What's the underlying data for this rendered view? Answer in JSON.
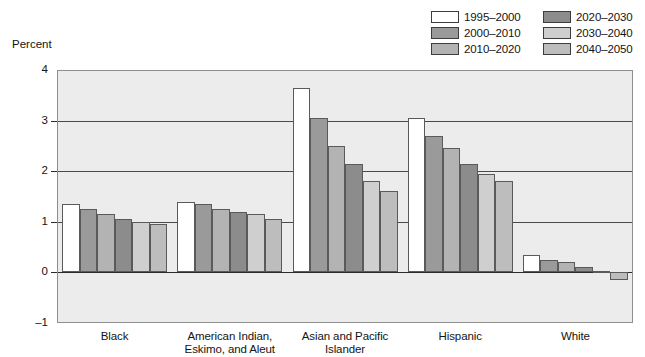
{
  "axis_title": "Percent",
  "legend": {
    "items": [
      {
        "label": "1995–2000",
        "color": "#ffffff"
      },
      {
        "label": "2000–2010",
        "color": "#9a9a9a"
      },
      {
        "label": "2010–2020",
        "color": "#b3b3b3"
      },
      {
        "label": "2020–2030",
        "color": "#8c8c8c"
      },
      {
        "label": "2030–2040",
        "color": "#cfcfcf"
      },
      {
        "label": "2040–2050",
        "color": "#bdbdbd"
      }
    ]
  },
  "chart_data": {
    "type": "bar",
    "title": "",
    "subtitle": "",
    "xlabel": "",
    "ylabel": "Percent",
    "ylim": [
      -1,
      4
    ],
    "yticks": [
      4,
      3,
      2,
      1,
      0,
      -1
    ],
    "ytick_labels": [
      "4",
      "3",
      "2",
      "1",
      "0",
      "–1"
    ],
    "grid": true,
    "legend_position": "top-right",
    "categories": [
      "Black",
      "American Indian, Eskimo, and Aleut",
      "Asian and Pacific Islander",
      "Hispanic",
      "White"
    ],
    "category_labels": [
      [
        "Black"
      ],
      [
        "American Indian,",
        "Eskimo, and Aleut"
      ],
      [
        "Asian and Pacific",
        "Islander"
      ],
      [
        "Hispanic"
      ],
      [
        "White"
      ]
    ],
    "series": [
      {
        "name": "1995–2000",
        "color": "#ffffff",
        "values": [
          1.35,
          1.4,
          3.65,
          3.05,
          0.35
        ]
      },
      {
        "name": "2000–2010",
        "color": "#9a9a9a",
        "values": [
          1.25,
          1.35,
          3.05,
          2.7,
          0.25
        ]
      },
      {
        "name": "2010–2020",
        "color": "#b3b3b3",
        "values": [
          1.15,
          1.25,
          2.5,
          2.45,
          0.2
        ]
      },
      {
        "name": "2020–2030",
        "color": "#8c8c8c",
        "values": [
          1.05,
          1.2,
          2.15,
          2.15,
          0.1
        ]
      },
      {
        "name": "2030–2040",
        "color": "#cfcfcf",
        "values": [
          1.0,
          1.15,
          1.8,
          1.95,
          0.02
        ]
      },
      {
        "name": "2040–2050",
        "color": "#bdbdbd",
        "values": [
          0.95,
          1.05,
          1.6,
          1.8,
          -0.15
        ]
      }
    ]
  }
}
